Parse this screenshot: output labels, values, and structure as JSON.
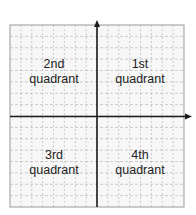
{
  "diagram": {
    "colors": {
      "background": "#ffffff",
      "plot_background": "#f7f7f7",
      "grid": "#b8b8b8",
      "border": "#9a9a9a",
      "axis": "#1a1a1a",
      "text": "#222222"
    },
    "grid": {
      "columns": 16,
      "rows": 16
    },
    "quadrants": [
      {
        "id": "q2",
        "ordinal": "2nd",
        "word": "quadrant"
      },
      {
        "id": "q1",
        "ordinal": "1st",
        "word": "quadrant"
      },
      {
        "id": "q3",
        "ordinal": "3rd",
        "word": "quadrant"
      },
      {
        "id": "q4",
        "ordinal": "4th",
        "word": "quadrant"
      }
    ]
  }
}
